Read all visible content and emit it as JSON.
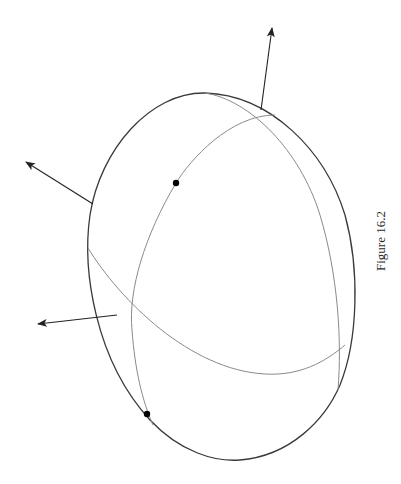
{
  "figure": {
    "caption": "Figure 16.2",
    "colors": {
      "outline": "#3a3a3a",
      "inner_curves": "#8a8a8a",
      "arrows": "#222222",
      "points": "#000000"
    },
    "elements": {
      "outer_outline": "ellipsoid outline",
      "inner_rim": "back rim curve",
      "equator": "horizontal great-circle curve",
      "meridian": "vertical great-circle curve",
      "arrows": [
        {
          "name": "normal-arrow-top",
          "tail": [
            261,
            110
          ],
          "tip": [
            272,
            28
          ]
        },
        {
          "name": "normal-arrow-upper-left",
          "tail": [
            93,
            204
          ],
          "tip": [
            26,
            162
          ]
        },
        {
          "name": "normal-arrow-lower-left",
          "tail": [
            117,
            315
          ],
          "tip": [
            38,
            324
          ]
        }
      ],
      "points": [
        {
          "name": "point-upper",
          "x": 176,
          "y": 183
        },
        {
          "name": "point-lower",
          "x": 147,
          "y": 414
        }
      ]
    }
  }
}
